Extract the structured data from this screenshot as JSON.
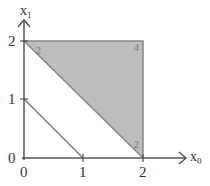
{
  "diagram": {
    "type": "feasible-region-plot",
    "axes": {
      "x": {
        "label": "x",
        "subscript": "0",
        "ticks": [
          "0",
          "1",
          "2"
        ]
      },
      "y": {
        "label": "x",
        "subscript": "1",
        "ticks": [
          "0",
          "1",
          "2"
        ]
      }
    },
    "line": {
      "from": [
        0,
        1
      ],
      "to": [
        1,
        0
      ]
    },
    "shaded_region": {
      "vertices": [
        [
          0,
          2
        ],
        [
          2,
          2
        ],
        [
          2,
          0
        ]
      ],
      "fill": "#bdbdbd",
      "stroke": "#888888",
      "vertex_labels": [
        {
          "at": [
            0,
            2
          ],
          "text": "2"
        },
        {
          "at": [
            2,
            2
          ],
          "text": "4"
        },
        {
          "at": [
            2,
            0
          ],
          "text": "2"
        }
      ]
    },
    "colors": {
      "axis": "#555555",
      "line": "#777777"
    }
  }
}
